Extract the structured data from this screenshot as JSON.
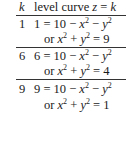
{
  "header": {
    "k": "k",
    "level_label": "level curve ",
    "z": "z",
    "eqk": " = ",
    "kvar": "k"
  },
  "rows": [
    {
      "k": "1",
      "lhs": "1",
      "or_rhs": "9"
    },
    {
      "k": "6",
      "lhs": "6",
      "or_rhs": "4"
    },
    {
      "k": "9",
      "lhs": "9",
      "or_rhs": "1"
    }
  ],
  "text": {
    "equals_ten": " = 10 − ",
    "minus": " − ",
    "or": "or ",
    "plus": " + ",
    "eq": " = ",
    "x": "x",
    "y": "y",
    "two": "2"
  }
}
